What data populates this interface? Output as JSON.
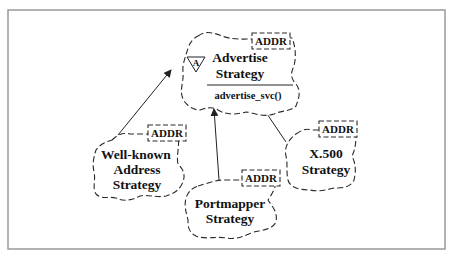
{
  "diagram": {
    "type": "class-diagram-booch-clouds",
    "colors": {
      "stroke": "#2a2a2a",
      "frame": "#9a9a9a",
      "background": "#ffffff"
    },
    "base_class": {
      "name_line1": "Advertise",
      "name_line2": "Strategy",
      "abstract_marker": "A",
      "method": "advertise_svc()",
      "template_param": "ADDR"
    },
    "subclasses": [
      {
        "id": "well-known",
        "lines": [
          "Well-known",
          "Address",
          "Strategy"
        ],
        "template_param": "ADDR"
      },
      {
        "id": "portmapper",
        "lines": [
          "Portmapper",
          "Strategy"
        ],
        "template_param": "ADDR"
      },
      {
        "id": "x500",
        "lines": [
          "X.500",
          "Strategy"
        ],
        "template_param": "ADDR"
      }
    ],
    "relationships": [
      {
        "from": "well-known",
        "to": "base_class",
        "kind": "inherits"
      },
      {
        "from": "portmapper",
        "to": "base_class",
        "kind": "inherits"
      },
      {
        "from": "x500",
        "to": "base_class",
        "kind": "inherits"
      }
    ]
  }
}
